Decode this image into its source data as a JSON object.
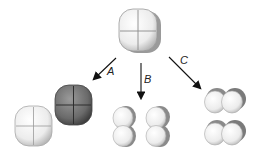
{
  "diagram": {
    "type": "cleavage-planes",
    "nodes": [
      {
        "id": "parent",
        "description": "four-cell embryo (top)"
      },
      {
        "id": "outcome-a",
        "description": "two four-cell groups, one light and one dark"
      },
      {
        "id": "outcome-b",
        "description": "two vertical two-cell pairs"
      },
      {
        "id": "outcome-c",
        "description": "two horizontal two-cell pairs"
      }
    ],
    "edges": [
      {
        "from": "parent",
        "to": "outcome-a",
        "label": "A"
      },
      {
        "from": "parent",
        "to": "outcome-b",
        "label": "B"
      },
      {
        "from": "parent",
        "to": "outcome-c",
        "label": "C"
      }
    ],
    "labels": {
      "a": "A",
      "b": "B",
      "c": "C"
    },
    "colors": {
      "light_cell": "#f2f2f2",
      "dark_cell": "#6a6a6a",
      "outline": "#8a8a8a",
      "arrow": "#111111"
    }
  }
}
